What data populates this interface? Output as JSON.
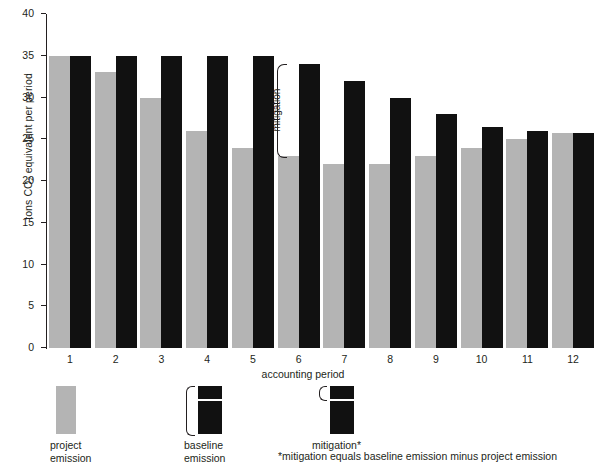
{
  "chart_data": {
    "type": "bar",
    "title": "",
    "subtitle": "",
    "xlabel": "accounting period",
    "ylabel": "tons CO2 equivalent  per period",
    "ylabel_prefix": "tons CO",
    "ylabel_sub": "2",
    "ylabel_suffix": " equivalent  per period",
    "categories": [
      "1",
      "2",
      "3",
      "4",
      "5",
      "6",
      "7",
      "8",
      "9",
      "10",
      "11",
      "12"
    ],
    "ylim": [
      0,
      40
    ],
    "yticks": [
      0,
      5,
      10,
      15,
      20,
      25,
      30,
      35,
      40
    ],
    "ytick_labels": [
      "0",
      "5",
      "10",
      "15",
      "20",
      "25",
      "30",
      "35",
      "40"
    ],
    "grid": false,
    "legend_position": "below-left",
    "series": [
      {
        "name": "project emission",
        "color": "#b4b4b4",
        "values": [
          35,
          33,
          30,
          26,
          24,
          23,
          22,
          22,
          23,
          24,
          25,
          25.8
        ]
      },
      {
        "name": "baseline emission",
        "color": "#111111",
        "values": [
          35,
          35,
          35,
          35,
          35,
          34,
          32,
          30,
          28,
          26.5,
          26,
          25.8
        ]
      }
    ],
    "annotations": [
      {
        "name": "mitigation",
        "label": "mitigation",
        "category": "6",
        "from": 23,
        "to": 34
      }
    ]
  },
  "legend": {
    "items": [
      {
        "label": "project\nemission",
        "swatch": "gray",
        "brace": false
      },
      {
        "label": "baseline\nemission",
        "swatch": "stacked",
        "brace": "full"
      },
      {
        "label": "mitigation*",
        "swatch": "stacked",
        "brace": "top"
      }
    ]
  },
  "footnote": "*mitigation equals baseline emission minus project emission"
}
